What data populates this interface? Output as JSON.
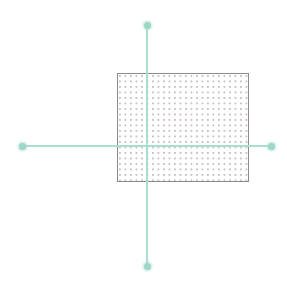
{
  "canvas": {
    "width": 287,
    "height": 289,
    "background_color": "#ffffff",
    "label": "Drawing canvas"
  },
  "shape": {
    "type": "rectangle",
    "name": "Rectangle",
    "x": 117,
    "y": 73,
    "width": 132,
    "height": 109,
    "border_color": "#8a8a8a",
    "border_width": 1,
    "fill_style": "dotted",
    "fill_color": "#ffffff",
    "dot_color": "#c9bfc4",
    "dot_spacing": 5.5
  },
  "crosshair": {
    "name": "Selection crosshair",
    "color": "#a8ddd0",
    "handle_color": "#9ed6c7",
    "center_x": 147,
    "center_y": 146,
    "line_thickness": 2,
    "handle_size": 7,
    "vertical_line": {
      "label": "Vertical guide line",
      "x": 147,
      "top": 25,
      "bottom": 266
    },
    "horizontal_line": {
      "label": "Horizontal guide line",
      "y": 146,
      "left": 22,
      "right": 271
    },
    "handles": [
      {
        "label": "Top handle",
        "position": "top",
        "x": 147,
        "y": 25
      },
      {
        "label": "Right handle",
        "position": "right",
        "x": 271,
        "y": 146
      },
      {
        "label": "Bottom handle",
        "position": "bottom",
        "x": 147,
        "y": 266
      },
      {
        "label": "Left handle",
        "position": "left",
        "x": 22,
        "y": 146
      }
    ]
  }
}
